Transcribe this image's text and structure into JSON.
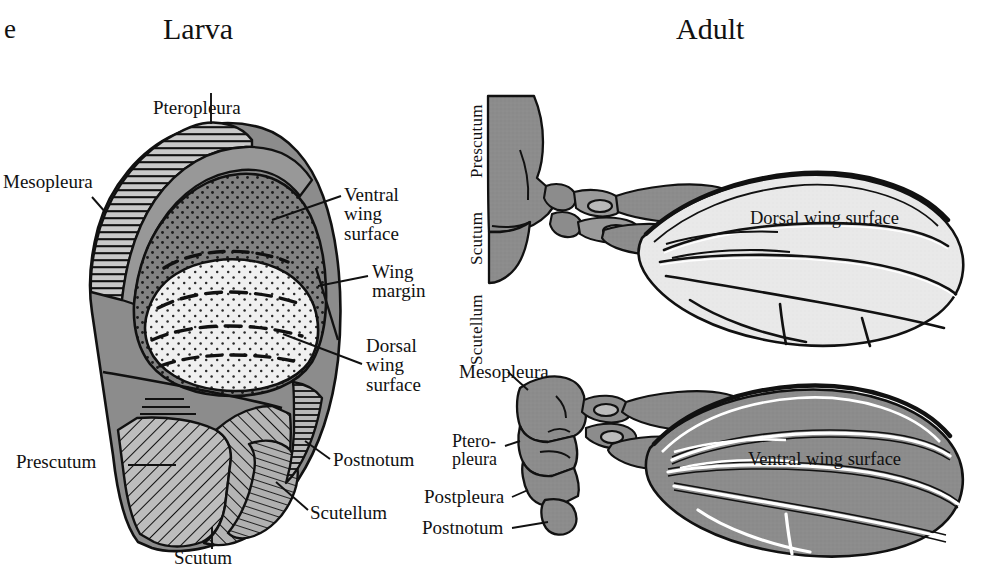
{
  "figure": {
    "panel_letter": "e",
    "background_color": "#ffffff",
    "ink_color": "#111111"
  },
  "titles": {
    "larva": "Larva",
    "adult": "Adult"
  },
  "palette": {
    "body_gray": "#8c8c8c",
    "wing_ventral_gray": "#8f8f8f",
    "wing_dorsal_light": "#e9e9e9",
    "stipple_dark": "#7e7e7e",
    "stipple_light": "#efefef",
    "outline": "#111111",
    "vein_white": "#ffffff"
  },
  "larva": {
    "labels": {
      "pteropleura": "Pteropleura",
      "mesopleura": "Mesopleura",
      "ventral_wing_surface": "Ventral\nwing\nsurface",
      "wing_margin": "Wing\nmargin",
      "dorsal_wing_surface": "Dorsal\nwing\nsurface",
      "prescutum": "Prescutum",
      "postnotum": "Postnotum",
      "scutellum": "Scutellum",
      "scutum": "Scutum"
    }
  },
  "adult_dorsal": {
    "labels": {
      "prescutum": "Prescutum",
      "scutum": "Scutum",
      "scutellum": "Scutellum",
      "wing_surface": "Dorsal wing surface"
    }
  },
  "adult_ventral": {
    "labels": {
      "mesopleura": "Mesopleura",
      "pteropleura": "Ptero-\npleura",
      "postpleura": "Postpleura",
      "postnotum": "Postnotum",
      "wing_surface": "Ventral wing surface"
    }
  }
}
